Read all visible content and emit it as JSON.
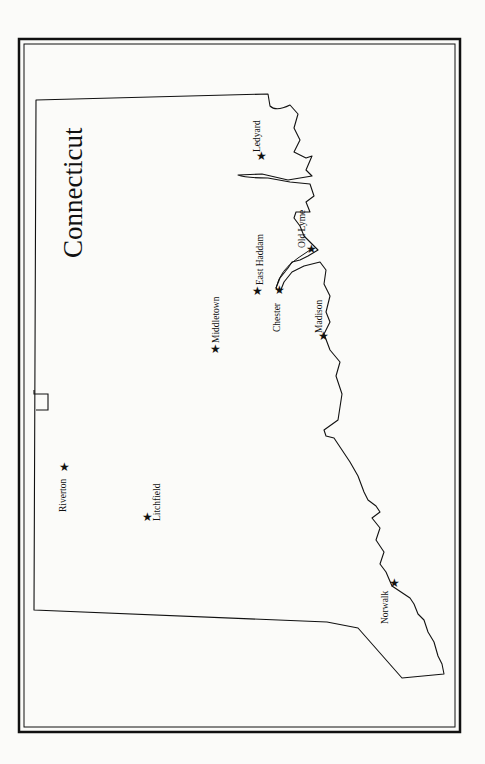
{
  "map": {
    "title": "Connecticut",
    "colors": {
      "ink": "#111111",
      "paper": "#fbfbf9"
    },
    "marker_icon": "★",
    "cities": [
      {
        "name": "Ledyard",
        "x": 261,
        "y": 156
      },
      {
        "name": "Old Lyme",
        "x": 311,
        "y": 249
      },
      {
        "name": "East Haddam",
        "x": 257,
        "y": 291
      },
      {
        "name": "Chester",
        "x": 279,
        "y": 290
      },
      {
        "name": "Madison",
        "x": 323,
        "y": 336
      },
      {
        "name": "Middletown",
        "x": 215,
        "y": 349
      },
      {
        "name": "Riverton",
        "x": 64,
        "y": 467
      },
      {
        "name": "Litchfield",
        "x": 147,
        "y": 517
      },
      {
        "name": "Norwalk",
        "x": 394,
        "y": 583
      }
    ]
  }
}
